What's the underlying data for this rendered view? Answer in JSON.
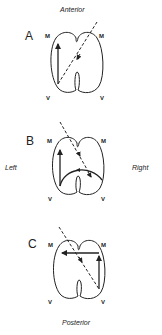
{
  "orientation": {
    "top": "Anterior",
    "bottom": "Posterior",
    "left": "Left",
    "right": "Right"
  },
  "panels": [
    {
      "letter": "A",
      "top_left": "M",
      "top_right": "M",
      "bottom_left": "V",
      "bottom_right": "V"
    },
    {
      "letter": "B",
      "top_left": "M",
      "top_right": "M",
      "bottom_left": "V",
      "bottom_right": "V"
    },
    {
      "letter": "C",
      "top_left": "M",
      "top_right": "M",
      "bottom_left": "V",
      "bottom_right": "V"
    }
  ],
  "colors": {
    "line": "#222222",
    "background": "#ffffff"
  }
}
